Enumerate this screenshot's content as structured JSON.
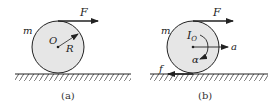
{
  "panels": [
    {
      "caption": "(a)",
      "mass_label": "m",
      "force_label": "F",
      "center_label": "O",
      "radius_label": "R"
    },
    {
      "caption": "(b)",
      "mass_label": "m",
      "force_label": "F",
      "inertia_label": "I",
      "inertia_sub": "O",
      "accel_label": "a",
      "alpha_label": "α",
      "friction_label": "f"
    }
  ],
  "colors": {
    "disk_fill": "#e6e6e6",
    "stroke": "#222222"
  }
}
